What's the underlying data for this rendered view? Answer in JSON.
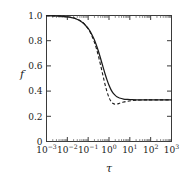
{
  "chart_data": {
    "type": "line",
    "title": "",
    "subtitle": "",
    "xlabel": "τ",
    "ylabel": "f",
    "xscale": "log",
    "yscale": "linear",
    "xlim": [
      0.001,
      1000
    ],
    "ylim": [
      0,
      1.0
    ],
    "grid": false,
    "legend": "none",
    "annotations": [],
    "x_tick_labels": [
      "10^-3",
      "10^-2",
      "10^-1",
      "10^0",
      "10^1",
      "10^2",
      "10^3"
    ],
    "x_tick_mantissas": [
      "10",
      "10",
      "10",
      "10",
      "10",
      "10",
      "10"
    ],
    "x_tick_exponents": [
      "−3",
      "−2",
      "−1",
      "0",
      "1",
      "2",
      "3"
    ],
    "x_tick_values": [
      0.001,
      0.01,
      0.1,
      1,
      10,
      100,
      1000
    ],
    "y_tick_labels": [
      "0",
      "0.2",
      "0.4",
      "0.6",
      "0.8",
      "1.0"
    ],
    "y_tick_values": [
      0,
      0.2,
      0.4,
      0.6,
      0.8,
      1.0
    ],
    "plateau_value": 0.33,
    "series": [
      {
        "name": "solid curve",
        "style": "solid",
        "color": "#1a1a1a",
        "x": [
          0.001,
          0.002,
          0.004,
          0.0063,
          0.01,
          0.0158,
          0.025,
          0.04,
          0.0631,
          0.1,
          0.126,
          0.158,
          0.2,
          0.251,
          0.316,
          0.398,
          0.501,
          0.631,
          0.794,
          1.0,
          1.26,
          1.58,
          2.0,
          2.51,
          3.16,
          5.0,
          7.94,
          12.6,
          20.0,
          50.0,
          100.0,
          316.0,
          1000.0
        ],
        "y": [
          0.998,
          0.997,
          0.995,
          0.993,
          0.989,
          0.983,
          0.974,
          0.959,
          0.935,
          0.897,
          0.872,
          0.841,
          0.805,
          0.762,
          0.712,
          0.657,
          0.599,
          0.543,
          0.491,
          0.446,
          0.41,
          0.384,
          0.366,
          0.353,
          0.345,
          0.337,
          0.334,
          0.332,
          0.331,
          0.33,
          0.33,
          0.33,
          0.33
        ]
      },
      {
        "name": "dashed curve",
        "style": "dashed",
        "color": "#1a1a1a",
        "x": [
          0.001,
          0.002,
          0.004,
          0.0063,
          0.01,
          0.0158,
          0.025,
          0.04,
          0.0631,
          0.1,
          0.126,
          0.158,
          0.2,
          0.251,
          0.316,
          0.398,
          0.501,
          0.631,
          0.794,
          1.0,
          1.26,
          1.58,
          2.0,
          2.51,
          3.16,
          5.0,
          7.94,
          12.6,
          20.0,
          50.0,
          100.0,
          316.0,
          1000.0
        ],
        "y": [
          0.998,
          0.997,
          0.996,
          0.994,
          0.991,
          0.986,
          0.977,
          0.961,
          0.936,
          0.894,
          0.866,
          0.83,
          0.787,
          0.735,
          0.673,
          0.604,
          0.531,
          0.46,
          0.397,
          0.349,
          0.318,
          0.301,
          0.296,
          0.298,
          0.303,
          0.313,
          0.32,
          0.325,
          0.328,
          0.33,
          0.33,
          0.33,
          0.33
        ]
      }
    ]
  },
  "colors": {
    "background": "#ffffff",
    "axis": "#3a3a3a",
    "text": "#1a1a1a",
    "curve": "#1a1a1a"
  }
}
